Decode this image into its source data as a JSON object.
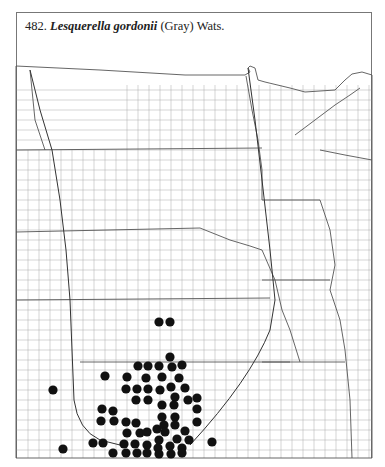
{
  "header": {
    "number": "482.",
    "species": "Lesquerella gordonii",
    "authority": "(Gray) Wats."
  },
  "map": {
    "region": "North-central United States county outline map",
    "line_color": "#555555",
    "dot_color": "#111111",
    "dot_radius": 4.6,
    "dots": [
      [
        159,
        322
      ],
      [
        170,
        322
      ],
      [
        170,
        357
      ],
      [
        138,
        366
      ],
      [
        148,
        366
      ],
      [
        159,
        366
      ],
      [
        172,
        367
      ],
      [
        182,
        365
      ],
      [
        105,
        376
      ],
      [
        127,
        377
      ],
      [
        146,
        378
      ],
      [
        162,
        377
      ],
      [
        179,
        378
      ],
      [
        53,
        390
      ],
      [
        126,
        389
      ],
      [
        137,
        389
      ],
      [
        148,
        389
      ],
      [
        160,
        390
      ],
      [
        171,
        387
      ],
      [
        185,
        388
      ],
      [
        136,
        400
      ],
      [
        148,
        400
      ],
      [
        175,
        397
      ],
      [
        188,
        400
      ],
      [
        197,
        398
      ],
      [
        102,
        409
      ],
      [
        113,
        411
      ],
      [
        162,
        405
      ],
      [
        174,
        405
      ],
      [
        197,
        409
      ],
      [
        101,
        421
      ],
      [
        114,
        421
      ],
      [
        126,
        422
      ],
      [
        136,
        423
      ],
      [
        162,
        417
      ],
      [
        175,
        417
      ],
      [
        197,
        422
      ],
      [
        127,
        433
      ],
      [
        140,
        433
      ],
      [
        147,
        432
      ],
      [
        157,
        429
      ],
      [
        164,
        425
      ],
      [
        165,
        432
      ],
      [
        175,
        425
      ],
      [
        185,
        431
      ],
      [
        93,
        443
      ],
      [
        103,
        443
      ],
      [
        124,
        444
      ],
      [
        135,
        444
      ],
      [
        159,
        440
      ],
      [
        177,
        439
      ],
      [
        189,
        440
      ],
      [
        212,
        442
      ],
      [
        147,
        445
      ],
      [
        158,
        448
      ],
      [
        170,
        446
      ],
      [
        182,
        448
      ],
      [
        63,
        449
      ],
      [
        113,
        453
      ],
      [
        126,
        453
      ],
      [
        137,
        453
      ],
      [
        147,
        453
      ],
      [
        159,
        454
      ],
      [
        171,
        454
      ],
      [
        182,
        453
      ]
    ]
  }
}
